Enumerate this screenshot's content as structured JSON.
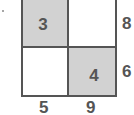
{
  "diagram": {
    "type": "2x2 grid",
    "cells": [
      {
        "position": "top-left",
        "label": "3",
        "shaded": true
      },
      {
        "position": "top-right",
        "label": "",
        "shaded": false
      },
      {
        "position": "bottom-left",
        "label": "",
        "shaded": false
      },
      {
        "position": "bottom-right",
        "label": "4",
        "shaded": true
      }
    ],
    "row_labels": [
      "8",
      "6"
    ],
    "column_labels": [
      "5",
      "9"
    ],
    "colors": {
      "shaded": "#d2d2d2",
      "border": "#555555",
      "text": "#555555"
    }
  }
}
